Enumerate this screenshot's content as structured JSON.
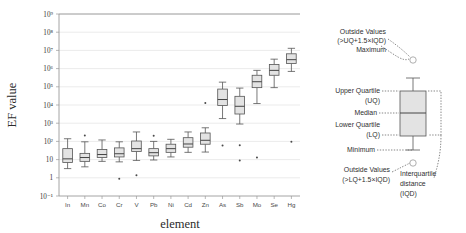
{
  "figure": {
    "name": "box-plot-ef-value-by-element",
    "background": "#ffffff"
  },
  "chart_data": {
    "type": "box",
    "title": "",
    "xlabel": "element",
    "ylabel": "EF value",
    "yscale": "log",
    "ylim": [
      0.1,
      1000000000
    ],
    "grid": true,
    "legend_position": "right",
    "categories": [
      "In",
      "Mn",
      "Co",
      "Cr",
      "V",
      "Pb",
      "Ni",
      "Cd",
      "Zn",
      "As",
      "Sb",
      "Mo",
      "Se",
      "Hg"
    ],
    "ytick_labels": [
      "10⁻¹",
      "1",
      "10",
      "10²",
      "10³",
      "10⁴",
      "10⁵",
      "10⁶",
      "10⁷",
      "10⁸",
      "10⁹"
    ],
    "ytick_values": [
      0.1,
      1,
      10,
      100,
      1000,
      10000,
      100000,
      1000000,
      10000000,
      100000000,
      1000000000
    ],
    "boxes": [
      {
        "category": "In",
        "min": 3.2,
        "lq": 7.0,
        "median": 11,
        "uq": 40,
        "max": 140,
        "outliers": []
      },
      {
        "category": "Mn",
        "min": 4.0,
        "lq": 8.0,
        "median": 13,
        "uq": 22,
        "max": 95,
        "outliers": [
          210
        ]
      },
      {
        "category": "Co",
        "min": 8.0,
        "lq": 13,
        "median": 19,
        "uq": 36,
        "max": 120,
        "outliers": []
      },
      {
        "category": "Cr",
        "min": 7.5,
        "lq": 14,
        "median": 21,
        "uq": 44,
        "max": 95,
        "outliers": [
          0.9
        ]
      },
      {
        "category": "V",
        "min": 9.0,
        "lq": 28,
        "median": 40,
        "uq": 105,
        "max": 330,
        "outliers": [
          1.4
        ]
      },
      {
        "category": "Pb",
        "min": 9.5,
        "lq": 16,
        "median": 24,
        "uq": 40,
        "max": 100,
        "outliers": [
          205
        ]
      },
      {
        "category": "Ni",
        "min": 14,
        "lq": 25,
        "median": 40,
        "uq": 70,
        "max": 130,
        "outliers": []
      },
      {
        "category": "Cd",
        "min": 25,
        "lq": 48,
        "median": 72,
        "uq": 160,
        "max": 330,
        "outliers": []
      },
      {
        "category": "Zn",
        "min": 26,
        "lq": 70,
        "median": 115,
        "uq": 290,
        "max": 560,
        "outliers": [
          13000
        ]
      },
      {
        "category": "As",
        "min": 1800,
        "lq": 9500,
        "median": 20000,
        "uq": 75000,
        "max": 180000,
        "outliers": [
          60
        ]
      },
      {
        "category": "Sb",
        "min": 900,
        "lq": 3200,
        "median": 8500,
        "uq": 30000,
        "max": 85000,
        "outliers": [
          9,
          62
        ]
      },
      {
        "category": "Mo",
        "min": 12000,
        "lq": 90000,
        "median": 190000,
        "uq": 430000,
        "max": 800000,
        "outliers": [
          13
        ]
      },
      {
        "category": "Se",
        "min": 90000,
        "lq": 430000,
        "median": 800000,
        "uq": 1700000,
        "max": 3300000,
        "outliers": []
      },
      {
        "category": "Hg",
        "min": 700000,
        "lq": 1900000,
        "median": 3100000,
        "uq": 6500000,
        "max": 13000000,
        "outliers": [
          95
        ]
      }
    ]
  },
  "legend": {
    "name": "boxplot-legend",
    "outside_values_top": "Outside Values",
    "outside_values_top_formula": "(>UQ+1.5×IQD)",
    "maximum": "Maximum",
    "upper_quartile": "Upper Quartile",
    "upper_quartile_abbr": "(UQ)",
    "median": "Median",
    "lower_quartile": "Lower Quartile",
    "lower_quartile_abbr": "(LQ)",
    "minimum": "Minimum",
    "outside_values_bottom": "Outside Values",
    "outside_values_bottom_formula": "(>LQ+1.5×IQD)",
    "iqd_line1": "Interquartile",
    "iqd_line2": "distance",
    "iqd_line3": "(IQD)"
  }
}
